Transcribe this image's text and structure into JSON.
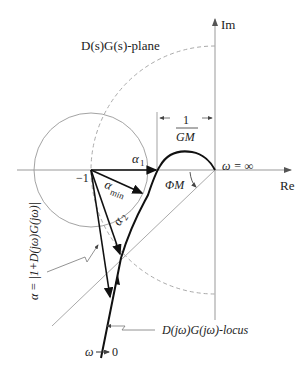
{
  "diagram": {
    "plane_label": "D(s)G(s)-plane",
    "axes": {
      "imag_label": "Im",
      "real_label": "Re"
    },
    "points": {
      "minus_one": "−1",
      "omega_inf": "ω = ∞",
      "omega_zero": "ω → 0"
    },
    "gain_margin": {
      "numerator": "1",
      "denominator": "GM"
    },
    "phase_margin_label": "ΦM",
    "alpha_labels": {
      "alpha1": "α",
      "alpha1_sub": "1",
      "alpha2": "α",
      "alpha2_sub": "2",
      "alpha_min": "α",
      "alpha_min_sub": "min"
    },
    "alpha_definition": "α = |1+D(jω)G(jω)|",
    "locus_label": "D(jω)G(jω)-locus",
    "colors": {
      "curve": "#111111",
      "axis": "#888888",
      "dashed_circle": "#999999",
      "thin": "#999999"
    }
  }
}
